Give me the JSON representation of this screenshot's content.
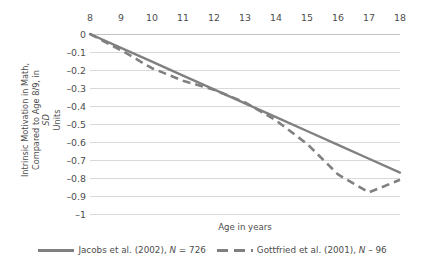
{
  "chart_data": {
    "type": "line",
    "title": "",
    "xlabel": "Age in years",
    "ylabel": "Intrinsic Motivation in Math, Compared to Age 8/9, in SD Units",
    "ylabel_line1": "Intrinsic Motivation in Math,",
    "ylabel_line2": "Compared to Age 8/9, in SD Units",
    "x_axis_position": "top",
    "grid": true,
    "legend_position": "bottom",
    "xlim": [
      8,
      18
    ],
    "ylim": [
      -1,
      0
    ],
    "x_tick_labels": [
      "8",
      "9",
      "10",
      "11",
      "12",
      "13",
      "14",
      "15",
      "16",
      "17",
      "18"
    ],
    "y_tick_labels": [
      "0",
      "–0.1",
      "–0.2",
      "–0.3",
      "–0.4",
      "–0.5",
      "–0.6",
      "–0.7",
      "–0.8",
      "–0.9",
      "–1"
    ],
    "x": [
      8,
      9,
      10,
      11,
      12,
      13,
      14,
      15,
      16,
      17,
      18
    ],
    "series": [
      {
        "name": "Jacobs et al. (2002), N = 726",
        "style": "solid",
        "color": "#808080",
        "values": [
          0,
          -0.077,
          -0.154,
          -0.231,
          -0.308,
          -0.385,
          -0.462,
          -0.539,
          -0.616,
          -0.693,
          -0.77
        ]
      },
      {
        "name": "Gottfried et al. (2001), N – 96",
        "style": "dashed",
        "color": "#808080",
        "values": [
          0,
          -0.09,
          -0.19,
          -0.26,
          -0.31,
          -0.38,
          -0.48,
          -0.61,
          -0.78,
          -0.88,
          -0.81
        ]
      }
    ]
  },
  "legend": {
    "items": [
      {
        "label_pre": "Jacobs et al. (2002), ",
        "label_italic": "N",
        "label_post": " = 726",
        "swatch": "solid-line-swatch"
      },
      {
        "label_pre": "Gottfried et al. (2001), ",
        "label_italic": "N",
        "label_post": " – 96",
        "swatch": "dashed-line-swatch"
      }
    ]
  },
  "axes": {
    "x_title": "Age in years",
    "y_title_line1": "Intrinsic Motivation in Math,",
    "y_title_line2_pre": "Compared to Age 8/9, in ",
    "y_title_line2_italic": "SD",
    "y_title_line2_post": " Units"
  }
}
